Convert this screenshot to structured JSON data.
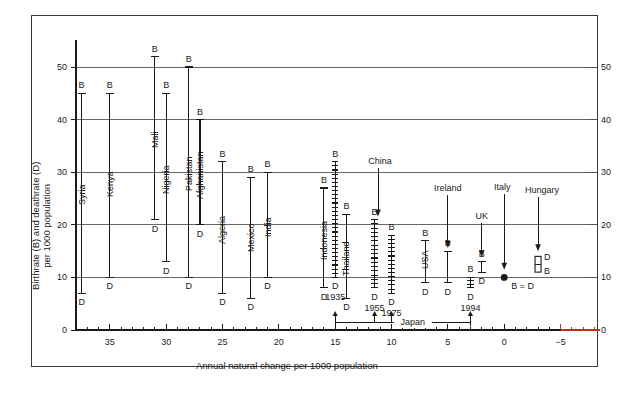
{
  "chart_data": {
    "type": "scatter",
    "title": "",
    "xlabel": "Annual natural change per 1000 population",
    "ylabel": "Birthrate (B) and deathrate (D) per 1000 population",
    "xlim": [
      38.5,
      -8.5
    ],
    "ylim": [
      0,
      54
    ],
    "x_reversed": true,
    "xticks_major": [
      35,
      30,
      25,
      20,
      15,
      10,
      5,
      0,
      -5
    ],
    "xticks_major_labels": [
      "35",
      "30",
      "25",
      "20",
      "15",
      "10",
      "5",
      "0",
      "−5"
    ],
    "xticks_minor_step": 1,
    "yticks": [
      0,
      10,
      20,
      30,
      40,
      50
    ],
    "yticks_labels_left": [
      "0",
      "10",
      "20",
      "30",
      "40",
      "50"
    ],
    "yticks_labels_right": [
      "0",
      "10",
      "20",
      "30",
      "40",
      "50"
    ],
    "grid": "horizontal",
    "grid_color": "#555555",
    "axis_color": "#1a1a1a",
    "red_axis_color": "#c03020",
    "red_axis_from_x": -5,
    "series_note": "Each country is a vertical bar from deathrate (D, lower cap) to birthrate (B, upper cap); x position = birthrate minus deathrate (annual natural change).",
    "countries": [
      {
        "name": "Syria",
        "x": 37.5,
        "B": 45,
        "D": 7,
        "marker": "bar",
        "label_rotated": true
      },
      {
        "name": "Kenya",
        "x": 35,
        "B": 45,
        "D": 10,
        "marker": "bar",
        "label_rotated": true
      },
      {
        "name": "Mali",
        "x": 31,
        "B": 52,
        "D": 21,
        "marker": "bar",
        "label_rotated": true
      },
      {
        "name": "Nigeria",
        "x": 30,
        "B": 45,
        "D": 13,
        "marker": "bar",
        "label_rotated": true
      },
      {
        "name": "Pakistan",
        "x": 28,
        "B": 50,
        "D": 10,
        "marker": "bar",
        "label_rotated": true
      },
      {
        "name": "Afghanistan",
        "x": 27,
        "B": 40,
        "D": 20,
        "marker": "bar",
        "label_rotated": true
      },
      {
        "name": "Algeria",
        "x": 25,
        "B": 32,
        "D": 7,
        "marker": "bar",
        "label_rotated": true
      },
      {
        "name": "Mexico",
        "x": 22.5,
        "B": 29,
        "D": 6,
        "marker": "bar",
        "label_rotated": true
      },
      {
        "name": "India",
        "x": 21,
        "B": 30,
        "D": 10,
        "marker": "bar",
        "label_rotated": true
      },
      {
        "name": "Indonesia",
        "x": 16,
        "B": 27,
        "D": 8,
        "marker": "bar",
        "label_rotated": true
      },
      {
        "name": "Thailand",
        "x": 14,
        "B": 22,
        "D": 6,
        "marker": "bar",
        "label_rotated": true
      },
      {
        "name": "USA",
        "x": 7,
        "B": 17,
        "D": 9,
        "marker": "bar",
        "label_rotated": true
      },
      {
        "name": "Ireland",
        "x": 5,
        "B": 15,
        "D": 9,
        "marker": "bar",
        "label_rotated": false
      },
      {
        "name": "UK",
        "x": 2,
        "B": 13,
        "D": 11,
        "marker": "bar",
        "label_rotated": false
      },
      {
        "name": "Italy",
        "x": 0,
        "B": 10,
        "D": 10,
        "marker": "dot",
        "label_rotated": false,
        "dot_label": "B = D"
      },
      {
        "name": "Hungary",
        "x": -3,
        "B": 11,
        "D": 14,
        "marker": "bar-inverted",
        "label_rotated": false
      }
    ],
    "japan_series": {
      "label": "Japan",
      "points": [
        {
          "year": "1935",
          "x": 15,
          "B": 32,
          "D": 10,
          "marker": "ladder"
        },
        {
          "year": "1955",
          "x": 11.5,
          "B": 21,
          "D": 8,
          "marker": "ladder"
        },
        {
          "year": "1975",
          "x": 10,
          "B": 18,
          "D": 7,
          "marker": "ladder"
        },
        {
          "year": "1994",
          "x": 3,
          "B": 10,
          "D": 8,
          "marker": "ladder"
        }
      ]
    },
    "annotations": [
      {
        "text": "China",
        "points_to_x": 11.2,
        "points_to_y": 21,
        "kind": "arrow"
      },
      {
        "text": "Ireland",
        "points_to_x": 5,
        "points_to_y": 15,
        "kind": "arrow"
      },
      {
        "text": "Italy",
        "points_to_x": 0,
        "points_to_y": 10.8,
        "kind": "arrow"
      },
      {
        "text": "Hungary",
        "points_to_x": -3,
        "points_to_y": 14.5,
        "kind": "arrow"
      },
      {
        "text": "UK",
        "points_to_x": 2,
        "points_to_y": 13,
        "kind": "arrow"
      },
      {
        "text": "Japan",
        "kind": "bracket",
        "from_x": 15,
        "to_x": 3
      }
    ],
    "marker_caps": {
      "B": "B",
      "D": "D"
    }
  }
}
